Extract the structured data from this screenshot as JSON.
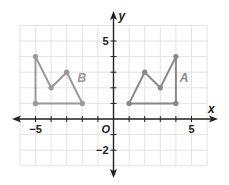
{
  "graph": {
    "origin_px": [
      113.5,
      119
    ],
    "unit_px": 15.6,
    "grid": {
      "x_range": [
        -6,
        6
      ],
      "y_range": [
        -3,
        6
      ],
      "color": "#e3e3e3"
    },
    "axes": {
      "x_label": "x",
      "y_label": "y",
      "origin_label": "O",
      "x_tick_labels": [
        {
          "value": -5,
          "text": "−5"
        },
        {
          "value": 5,
          "text": "5"
        }
      ],
      "y_tick_labels": [
        {
          "value": 5,
          "text": "5"
        },
        {
          "value": -2,
          "text": "−2"
        }
      ],
      "color": "#222222"
    },
    "figures": [
      {
        "name": "B",
        "label": "B",
        "label_pos": [
          -2.3,
          2.6
        ],
        "color": "#999999",
        "vertices": [
          [
            -5,
            1
          ],
          [
            -5,
            4
          ],
          [
            -4,
            2
          ],
          [
            -3,
            3
          ],
          [
            -2,
            1
          ]
        ]
      },
      {
        "name": "A",
        "label": "A",
        "label_pos": [
          4.25,
          2.6
        ],
        "color": "#888888",
        "vertices": [
          [
            1,
            1
          ],
          [
            2,
            3
          ],
          [
            3,
            2
          ],
          [
            4,
            4
          ],
          [
            4,
            1
          ]
        ]
      }
    ]
  }
}
